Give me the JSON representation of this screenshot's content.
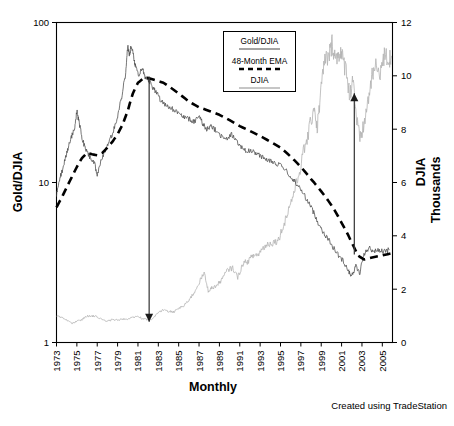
{
  "chart_data": {
    "type": "line",
    "title": "",
    "xlabel": "Monthly",
    "ylabel": "Gold/DJIA",
    "y2label": "DJIA Thousands",
    "yscale": "log",
    "ylim": [
      1,
      100
    ],
    "y2lim": [
      0,
      12
    ],
    "xlim": [
      1973,
      2006
    ],
    "grid": false,
    "legend_position": "top-center-inside",
    "yticks": [
      "1",
      "10",
      "100"
    ],
    "y2ticks": [
      "0",
      "2",
      "4",
      "6",
      "8",
      "10",
      "12"
    ],
    "xticks": [
      "1973",
      "1975",
      "1977",
      "1979",
      "1981",
      "1983",
      "1985",
      "1987",
      "1989",
      "1991",
      "1993",
      "1995",
      "1997",
      "1999",
      "2001",
      "2003",
      "2005"
    ],
    "credit": "Created using TradeStation",
    "series": [
      {
        "name": "Gold/DJIA",
        "axis": "left",
        "style": "solid",
        "color": "#4a4a4a",
        "x": [
          1973.0,
          1973.3,
          1973.6,
          1973.9,
          1974.2,
          1974.5,
          1974.8,
          1975.0,
          1975.2,
          1975.5,
          1975.8,
          1976.1,
          1976.4,
          1976.7,
          1977.0,
          1977.4,
          1977.8,
          1978.2,
          1978.6,
          1979.0,
          1979.4,
          1979.8,
          1980.0,
          1980.15,
          1980.3,
          1980.5,
          1980.7,
          1980.9,
          1981.1,
          1981.4,
          1981.7,
          1982.0,
          1982.3,
          1982.6,
          1982.9,
          1983.2,
          1983.6,
          1984.0,
          1984.5,
          1985.0,
          1985.5,
          1986.0,
          1986.5,
          1987.0,
          1987.4,
          1987.8,
          1988.2,
          1988.7,
          1989.2,
          1989.7,
          1990.2,
          1990.7,
          1991.2,
          1991.7,
          1992.2,
          1992.7,
          1993.2,
          1993.7,
          1994.2,
          1994.7,
          1995.2,
          1995.7,
          1996.2,
          1996.7,
          1997.2,
          1997.7,
          1998.2,
          1998.7,
          1999.2,
          1999.7,
          2000.2,
          2000.7,
          2001.2,
          2001.7,
          2002.0,
          2002.4,
          2002.8,
          2003.2,
          2003.7,
          2004.2,
          2004.7,
          2005.2,
          2005.7
        ],
        "y": [
          8.3,
          10.5,
          12.0,
          14.5,
          17.0,
          19.5,
          22.0,
          28.0,
          24.0,
          19.0,
          16.5,
          15.0,
          14.0,
          13.5,
          11.0,
          14.0,
          16.0,
          18.0,
          21.0,
          26.0,
          34.0,
          48.0,
          72.0,
          62.0,
          70.0,
          66.0,
          55.0,
          50.0,
          47.0,
          52.0,
          46.0,
          44.0,
          41.0,
          38.0,
          36.0,
          33.0,
          31.0,
          30.0,
          28.5,
          27.0,
          25.5,
          25.0,
          24.0,
          26.0,
          23.0,
          21.5,
          22.5,
          21.0,
          19.5,
          18.5,
          20.0,
          18.0,
          16.5,
          15.5,
          16.0,
          15.0,
          14.5,
          14.0,
          13.5,
          13.0,
          12.5,
          11.5,
          10.5,
          9.6,
          8.6,
          7.6,
          6.6,
          5.6,
          4.9,
          4.4,
          3.9,
          3.5,
          3.2,
          2.8,
          2.6,
          3.0,
          2.7,
          3.6,
          3.9,
          3.7,
          3.8,
          3.7,
          3.8
        ]
      },
      {
        "name": "48-Month EMA",
        "axis": "left",
        "style": "dashed",
        "color": "#000000",
        "x": [
          1973.0,
          1973.5,
          1974.0,
          1974.5,
          1975.0,
          1975.5,
          1976.0,
          1976.5,
          1977.0,
          1977.5,
          1978.0,
          1978.5,
          1979.0,
          1979.5,
          1980.0,
          1980.5,
          1981.0,
          1981.5,
          1982.0,
          1982.5,
          1983.0,
          1983.5,
          1984.0,
          1985.0,
          1986.0,
          1987.0,
          1988.0,
          1989.0,
          1990.0,
          1991.0,
          1992.0,
          1993.0,
          1994.0,
          1995.0,
          1996.0,
          1997.0,
          1998.0,
          1999.0,
          2000.0,
          2001.0,
          2002.0,
          2002.6,
          2003.2,
          2004.0,
          2005.0,
          2005.8
        ],
        "y": [
          7.0,
          8.0,
          9.3,
          10.8,
          12.5,
          14.2,
          15.3,
          15.0,
          14.8,
          15.3,
          16.5,
          18.0,
          20.0,
          23.0,
          28.0,
          36.0,
          42.0,
          44.5,
          45.0,
          44.0,
          43.0,
          42.0,
          40.0,
          36.0,
          32.0,
          29.5,
          28.0,
          26.5,
          24.5,
          22.5,
          21.0,
          19.5,
          18.0,
          16.5,
          14.5,
          12.5,
          10.5,
          8.8,
          7.2,
          5.6,
          4.2,
          3.5,
          3.3,
          3.4,
          3.5,
          3.6
        ]
      },
      {
        "name": "DJIA",
        "axis": "right",
        "style": "solid",
        "color": "#b3b3b3",
        "x": [
          1973.0,
          1973.5,
          1974.0,
          1974.5,
          1975.0,
          1975.5,
          1976.0,
          1976.5,
          1977.0,
          1977.5,
          1978.0,
          1978.5,
          1979.0,
          1979.5,
          1980.0,
          1980.5,
          1981.0,
          1981.5,
          1982.0,
          1982.5,
          1983.0,
          1983.5,
          1984.0,
          1984.5,
          1985.0,
          1985.5,
          1986.0,
          1986.5,
          1987.0,
          1987.5,
          1987.9,
          1988.3,
          1988.8,
          1989.3,
          1989.8,
          1990.3,
          1990.8,
          1991.3,
          1991.8,
          1992.3,
          1992.8,
          1993.3,
          1993.8,
          1994.3,
          1994.8,
          1995.3,
          1995.8,
          1996.3,
          1996.8,
          1997.3,
          1997.8,
          1998.3,
          1998.6,
          1998.9,
          1999.3,
          1999.8,
          2000.1,
          2000.4,
          2000.8,
          2001.1,
          2001.5,
          2001.8,
          2002.1,
          2002.5,
          2002.8,
          2003.1,
          2003.5,
          2003.9,
          2004.3,
          2004.8,
          2005.2,
          2005.7,
          2005.9
        ],
        "y": [
          1.02,
          0.93,
          0.85,
          0.71,
          0.8,
          0.85,
          1.0,
          0.99,
          0.96,
          0.85,
          0.8,
          0.86,
          0.84,
          0.88,
          0.87,
          0.95,
          0.98,
          0.88,
          0.85,
          0.9,
          1.12,
          1.22,
          1.18,
          1.14,
          1.3,
          1.36,
          1.6,
          1.85,
          2.25,
          2.6,
          1.95,
          2.05,
          2.15,
          2.4,
          2.72,
          2.8,
          2.45,
          2.95,
          3.05,
          3.25,
          3.3,
          3.55,
          3.7,
          3.75,
          3.85,
          4.4,
          5.0,
          5.6,
          6.3,
          7.2,
          7.9,
          8.9,
          8.0,
          9.2,
          10.5,
          10.8,
          11.25,
          10.6,
          10.95,
          10.6,
          10.2,
          9.2,
          10.0,
          8.3,
          7.6,
          8.0,
          8.8,
          9.8,
          10.3,
          10.2,
          10.7,
          10.6,
          10.75
        ]
      }
    ],
    "annotations": [
      {
        "name": "gold-peak-down-arrow",
        "direction": "down",
        "x": 1982.1,
        "y_from": 46,
        "y_to": 1.35
      },
      {
        "name": "djia-rally-up-arrow",
        "direction": "up",
        "x": 2002.25,
        "y2_from": 3.3,
        "y2_to": 9.35
      }
    ]
  },
  "legend": {
    "entries": [
      {
        "label": "Gold/DJIA",
        "style": "solid-dark"
      },
      {
        "label": "48-Month EMA",
        "style": "dashed"
      },
      {
        "label": "DJIA",
        "style": "solid-light"
      }
    ]
  },
  "axes": {
    "left_title": "Gold/DJIA",
    "right_title_line1": "DJIA",
    "right_title_line2": "Thousands",
    "bottom_title": "Monthly"
  },
  "footer": {
    "credit": "Created using TradeStation"
  },
  "colors": {
    "gold_series": "#4a4a4a",
    "djia_series": "#b3b3b3",
    "ema_series": "#000000",
    "frame": "#000000",
    "annotation": "#3a3a3a"
  }
}
